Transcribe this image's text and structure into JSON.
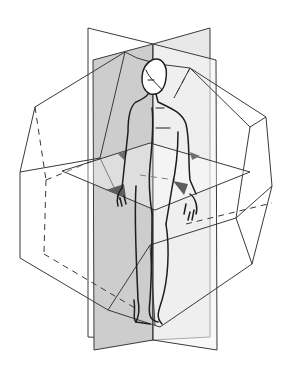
{
  "figure": {
    "title": "Anatomical planes of the human body",
    "elements": [
      "sagittal-plane",
      "coronal-plane",
      "transverse-plane",
      "polyhedron-frame",
      "human-figure"
    ],
    "colors": {
      "line": "#3a3a3a",
      "plane_dark": "#c8c8c8",
      "plane_light": "#ececec",
      "shadow": "#6e6e6e",
      "background": "#ffffff"
    }
  }
}
